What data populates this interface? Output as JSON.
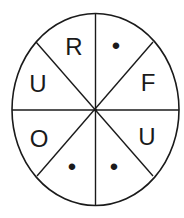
{
  "diagram": {
    "shape": "ellipse",
    "sectors": 8,
    "stroke_color": "#1a1a1a",
    "fill_color": "#ffffff",
    "labels": [
      {
        "position": "top-left",
        "text": "R"
      },
      {
        "position": "top-right",
        "text": "•"
      },
      {
        "position": "right-upper",
        "text": "F"
      },
      {
        "position": "right-lower",
        "text": "U"
      },
      {
        "position": "bottom-right",
        "text": "•"
      },
      {
        "position": "bottom-left",
        "text": "•"
      },
      {
        "position": "left-lower",
        "text": "O"
      },
      {
        "position": "left-upper",
        "text": "U"
      }
    ]
  }
}
